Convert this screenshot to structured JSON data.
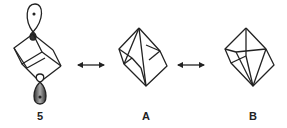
{
  "diagram": {
    "type": "resonance-structures",
    "structures": [
      {
        "id": "5",
        "label": "5",
        "description": "cubane-like cage with two p-orbital lobes at opposite vertices"
      },
      {
        "id": "A",
        "label": "A",
        "description": "cage with transannular bond (top-bottom)"
      },
      {
        "id": "B",
        "label": "B",
        "description": "cage with transannular bond (alternate)"
      }
    ],
    "arrows": [
      {
        "from": "5",
        "to": "A",
        "kind": "double-headed resonance arrow"
      },
      {
        "from": "A",
        "to": "B",
        "kind": "double-headed resonance arrow"
      }
    ],
    "colors": {
      "line": "#222222",
      "lobe_fill_light": "#ffffff",
      "lobe_fill_dark": "#555555"
    }
  }
}
